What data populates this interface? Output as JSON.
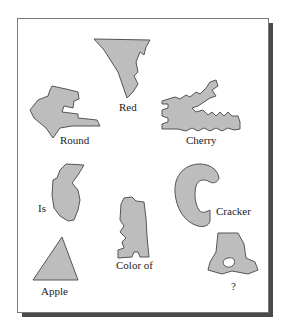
{
  "figure": {
    "labels": {
      "red": "Red",
      "round": "Round",
      "cherry": "Cherry",
      "is": "Is",
      "cracker": "Cracker",
      "color_of": "Color of",
      "apple": "Apple",
      "question": "?"
    },
    "colors": {
      "shape_fill": "#bdbdbd",
      "shape_stroke": "#555555",
      "card_background": "#ffffff",
      "shadow": "#4a4a4a"
    }
  }
}
